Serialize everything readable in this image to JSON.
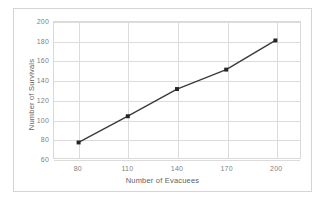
{
  "chart_data": {
    "type": "line",
    "title": "",
    "xlabel": "Number of Evacuees",
    "ylabel": "Number of Survivals",
    "x": [
      80,
      110,
      140,
      170,
      200
    ],
    "values": [
      76,
      103,
      131,
      151,
      181
    ],
    "series": [
      {
        "name": "Survivals",
        "values": [
          76,
          103,
          131,
          151,
          181
        ]
      }
    ],
    "xlim": [
      65,
      215
    ],
    "ylim": [
      60,
      200
    ],
    "xticks": [
      80,
      110,
      140,
      170,
      200
    ],
    "yticks": [
      60,
      80,
      100,
      120,
      140,
      160,
      180,
      200
    ],
    "xtick_labels": [
      "80",
      "110",
      "140",
      "170",
      "200"
    ],
    "ytick_labels": [
      "60",
      "80",
      "100",
      "120",
      "140",
      "160",
      "180",
      "200"
    ],
    "grid": true,
    "legend": false,
    "legend_position": "none",
    "markers": "square",
    "line_color": "#3b3b3b",
    "marker_color": "#262626",
    "grid_color": "#dcdcdc",
    "tick_label_color": "#7f7f7f",
    "axis_title_color": "#636363",
    "plot_background": "#ffffff",
    "frame_border_color": "#d4d4d4"
  }
}
